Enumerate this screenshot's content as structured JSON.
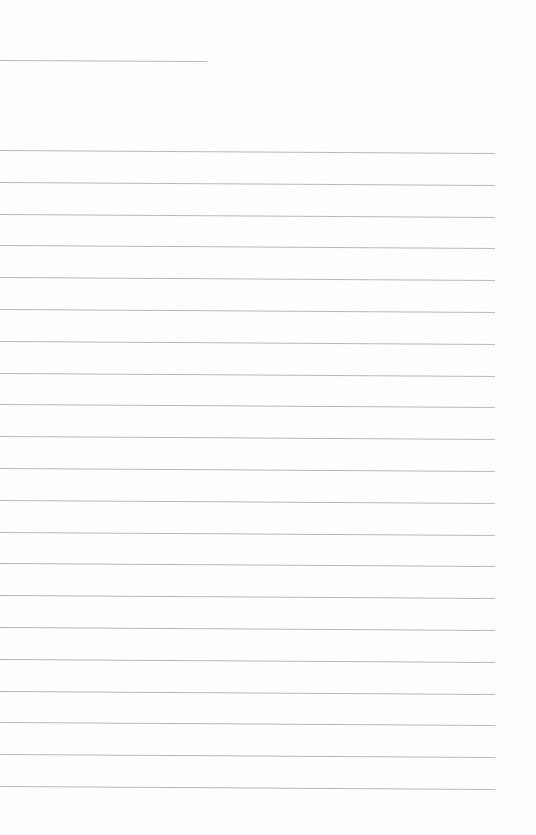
{
  "page": {
    "type": "lined-notepaper",
    "background": "#fefefe",
    "line_color": "#b9b9b9",
    "header_line": {
      "top": 60,
      "width": 207
    },
    "body_lines": {
      "first_top": 150,
      "spacing": 31.8,
      "count": 21,
      "width": 495
    },
    "text": ""
  }
}
